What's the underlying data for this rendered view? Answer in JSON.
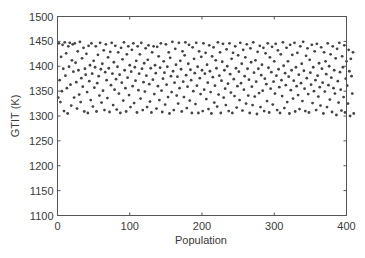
{
  "chart_data": {
    "type": "scatter",
    "title": "",
    "xlabel": "Population",
    "ylabel": "GTIT (K)",
    "xlim": [
      0,
      400
    ],
    "ylim": [
      1100,
      1500
    ],
    "xticks": [
      0,
      100,
      200,
      300,
      400
    ],
    "yticks": [
      1100,
      1150,
      1200,
      1250,
      1300,
      1350,
      1400,
      1450,
      1500
    ],
    "grid": false,
    "legend": null,
    "marker": "dot",
    "marker_color": "#444444",
    "series": [
      {
        "name": "GTIT",
        "x_start": 1,
        "x_step": 1,
        "y": [
          1337,
          1446,
          1372,
          1328,
          1419,
          1350,
          1443,
          1395,
          1310,
          1448,
          1381,
          1426,
          1356,
          1305,
          1440,
          1399,
          1447,
          1363,
          1321,
          1412,
          1444,
          1389,
          1337,
          1446,
          1407,
          1368,
          1315,
          1430,
          1392,
          1343,
          1449,
          1328,
          1376,
          1416,
          1359,
          1437,
          1309,
          1395,
          1383,
          1425,
          1348,
          1306,
          1441,
          1370,
          1402,
          1332,
          1446,
          1385,
          1319,
          1411,
          1357,
          1398,
          1440,
          1309,
          1366,
          1423,
          1380,
          1341,
          1447,
          1394,
          1327,
          1405,
          1351,
          1432,
          1312,
          1388,
          1444,
          1372,
          1336,
          1418,
          1396,
          1308,
          1429,
          1362,
          1447,
          1385,
          1322,
          1408,
          1353,
          1441,
          1374,
          1313,
          1399,
          1428,
          1345,
          1383,
          1306,
          1437,
          1367,
          1414,
          1331,
          1448,
          1392,
          1356,
          1309,
          1424,
          1377,
          1440,
          1342,
          1402,
          1318,
          1389,
          1433,
          1360,
          1446,
          1326,
          1398,
          1371,
          1411,
          1307,
          1440,
          1352,
          1385,
          1424,
          1335,
          1447,
          1395,
          1312,
          1368,
          1406,
          1349,
          1436,
          1381,
          1318,
          1413,
          1442,
          1364,
          1329,
          1396,
          1307,
          1428,
          1373,
          1440,
          1344,
          1402,
          1386,
          1315,
          1439,
          1360,
          1420,
          1332,
          1397,
          1446,
          1351,
          1308,
          1375,
          1410,
          1387,
          1323,
          1444,
          1363,
          1399,
          1338,
          1428,
          1305,
          1417,
          1380,
          1348,
          1449,
          1390,
          1312,
          1367,
          1435,
          1403,
          1341,
          1379,
          1325,
          1447,
          1356,
          1411,
          1394,
          1309,
          1430,
          1369,
          1338,
          1422,
          1448,
          1382,
          1316,
          1359,
          1405,
          1443,
          1331,
          1393,
          1372,
          1306,
          1438,
          1350,
          1415,
          1386,
          1324,
          1447,
          1361,
          1399,
          1306,
          1430,
          1376,
          1344,
          1419,
          1392,
          1310,
          1446,
          1353,
          1385,
          1427,
          1334,
          1403,
          1367,
          1314,
          1442,
          1390,
          1348,
          1305,
          1420,
          1378,
          1438,
          1327,
          1361,
          1412,
          1396,
          1319,
          1448,
          1343,
          1381,
          1428,
          1306,
          1371,
          1409,
          1445,
          1337,
          1392,
          1355,
          1322,
          1434,
          1400,
          1365,
          1310,
          1446,
          1384,
          1347,
          1415,
          1306,
          1427,
          1374,
          1340,
          1440,
          1396,
          1317,
          1360,
          1422,
          1389,
          1332,
          1447,
          1366,
          1405,
          1311,
          1433,
          1353,
          1380,
          1418,
          1325,
          1444,
          1395,
          1341,
          1373,
          1306,
          1436,
          1408,
          1359,
          1322,
          1448,
          1387,
          1339,
          1412,
          1369,
          1304,
          1429,
          1395,
          1346,
          1441,
          1318,
          1382,
          1403,
          1351,
          1437,
          1310,
          1375,
          1426,
          1364,
          1330,
          1446,
          1397,
          1307,
          1418,
          1355,
          1388,
          1439,
          1323,
          1369,
          1410,
          1345,
          1445,
          1381,
          1312,
          1432,
          1394,
          1358,
          1306,
          1424,
          1372,
          1340,
          1448,
          1401,
          1316,
          1386,
          1362,
          1437,
          1328,
          1410,
          1379,
          1305,
          1443,
          1352,
          1392,
          1423,
          1335,
          1371,
          1447,
          1309,
          1398,
          1360,
          1427,
          1342,
          1383,
          1314,
          1440,
          1366,
          1405,
          1330,
          1449,
          1391,
          1355,
          1310,
          1421,
          1376,
          1436,
          1344,
          1307,
          1413,
          1387,
          1363,
          1443,
          1326,
          1398,
          1350,
          1430,
          1372,
          1312,
          1445,
          1381,
          1339,
          1406,
          1358,
          1321,
          1438,
          1395,
          1367,
          1305,
          1428,
          1349,
          1410,
          1384,
          1318,
          1446,
          1362,
          1400,
          1333,
          1424,
          1377,
          1308,
          1440,
          1356,
          1392,
          1345,
          1416,
          1302,
          1435,
          1370,
          1327,
          1447,
          1388,
          1353,
          1311,
          1420,
          1398,
          1338,
          1442,
          1307,
          1375,
          1410,
          1361,
          1325,
          1433,
          1390,
          1300,
          1415,
          1380,
          1345,
          1428,
          1305
        ]
      }
    ]
  }
}
